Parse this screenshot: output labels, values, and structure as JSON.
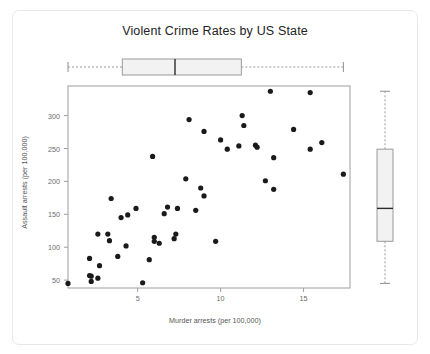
{
  "chart_data": {
    "type": "scatter",
    "title": "Violent Crime Rates by US State",
    "xlabel": "Murder arrests (per 100,000)",
    "ylabel": "Assault arrests (per 100,000)",
    "xlim": [
      0.8,
      17.8
    ],
    "ylim": [
      38,
      345
    ],
    "xticks": [
      5,
      10,
      15
    ],
    "yticks": [
      50,
      100,
      150,
      200,
      250,
      300
    ],
    "grid": false,
    "legend": null,
    "point_color": "#1a1a1a",
    "point_size_px": 2.6,
    "x": [
      13.2,
      10.0,
      8.1,
      8.8,
      9.0,
      7.9,
      3.3,
      5.9,
      15.4,
      17.4,
      5.3,
      2.6,
      10.4,
      7.2,
      2.2,
      6.0,
      9.7,
      15.4,
      2.1,
      11.3,
      4.4,
      12.1,
      2.7,
      16.1,
      9.0,
      6.0,
      4.3,
      12.2,
      2.1,
      7.4,
      11.4,
      11.1,
      13.0,
      0.8,
      7.3,
      6.6,
      4.9,
      6.3,
      3.4,
      14.4,
      3.8,
      13.2,
      12.7,
      3.2,
      2.2,
      8.5,
      4.0,
      5.7,
      2.6,
      6.8
    ],
    "y": [
      236,
      263,
      294,
      190,
      276,
      204,
      110,
      238,
      335,
      211,
      46,
      120,
      249,
      113,
      56,
      115,
      109,
      249,
      83,
      300,
      149,
      255,
      72,
      259,
      178,
      109,
      102,
      252,
      57,
      159,
      285,
      254,
      337,
      45,
      120,
      151,
      159,
      106,
      174,
      279,
      86,
      188,
      201,
      120,
      48,
      156,
      145,
      81,
      53,
      161
    ],
    "x_boxplot": {
      "orientation": "horizontal",
      "min": 0.8,
      "q1": 4.075,
      "median": 7.25,
      "q3": 11.25,
      "max": 17.4,
      "fill": "#f2f2f2",
      "stroke": "#9a9a9a",
      "median_stroke": "#2b2b2b",
      "whisker_style": "dashed"
    },
    "y_boxplot": {
      "orientation": "vertical",
      "min": 45,
      "q1": 109,
      "median": 159,
      "q3": 249,
      "max": 337,
      "fill": "#f2f2f2",
      "stroke": "#9a9a9a",
      "median_stroke": "#2b2b2b",
      "whisker_style": "dashed"
    }
  }
}
